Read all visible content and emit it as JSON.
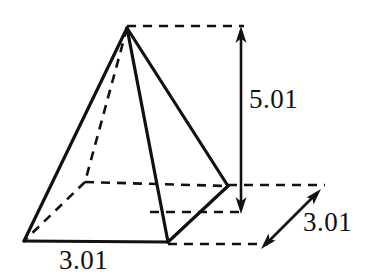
{
  "figure": {
    "name": "square-pyramid-dimensions",
    "shape": "square pyramid",
    "background_color": "#ffffff",
    "stroke_color": "#111111",
    "solid_stroke_width": 3.2,
    "hidden_stroke_width": 2.6,
    "dimension_stroke_width": 2.4,
    "hidden_dash_pattern": "9,7",
    "dimension_dash_pattern": "9,7"
  },
  "labels": {
    "height": "5.01",
    "depth": "3.01",
    "width": "3.01"
  },
  "geometry": {
    "apex": {
      "x": 127,
      "y": 28
    },
    "front_left": {
      "x": 24,
      "y": 241
    },
    "front_right": {
      "x": 168,
      "y": 242
    },
    "right": {
      "x": 228,
      "y": 186
    },
    "back_left_hidden": {
      "x": 85,
      "y": 182
    },
    "solid_edges": [
      {
        "name": "apex-to-front-left",
        "from": "apex",
        "to": "front_left"
      },
      {
        "name": "apex-to-front-right",
        "from": "apex",
        "to": "front_right"
      },
      {
        "name": "apex-to-right",
        "from": "apex",
        "to": "right"
      },
      {
        "name": "base-front",
        "from": "front_left",
        "to": "front_right"
      },
      {
        "name": "base-right",
        "from": "front_right",
        "to": "right"
      }
    ],
    "hidden_edges": [
      {
        "name": "apex-to-back-left",
        "from": "apex",
        "to": "back_left_hidden"
      },
      {
        "name": "base-back-left",
        "from": "back_left_hidden",
        "to": "front_left"
      },
      {
        "name": "base-back-right",
        "from": "back_left_hidden",
        "to": "right"
      }
    ]
  },
  "dimensions": {
    "height": {
      "label": "5.01",
      "arrow_x": 241,
      "arrow_top_y": 28,
      "arrow_bottom_y": 212,
      "double_headed": true,
      "extension_top": {
        "x1": 127,
        "y1": 26,
        "x2": 243,
        "y2": 26
      },
      "extension_bottom": {
        "x1": 153,
        "y1": 212,
        "x2": 243,
        "y2": 212
      }
    },
    "depth": {
      "label": "3.01",
      "arrow_start": {
        "x": 262,
        "y": 248
      },
      "arrow_end": {
        "x": 320,
        "y": 190
      },
      "double_headed": true,
      "extension_upper": {
        "x1": 228,
        "y1": 185,
        "x2": 324,
        "y2": 185
      },
      "extension_lower": {
        "x1": 168,
        "y1": 244,
        "x2": 266,
        "y2": 244
      }
    },
    "width": {
      "label": "3.01",
      "measured_edge": "base-front"
    }
  }
}
